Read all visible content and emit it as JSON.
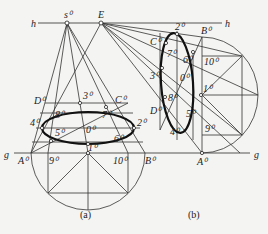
{
  "figure": {
    "lines": {
      "horizon": "h",
      "ground": "g"
    },
    "points": {
      "station": "s",
      "vanishing": "E"
    },
    "subfigure_a": {
      "caption": "(a)",
      "labels": [
        "D⁰",
        "3⁰",
        "C⁰",
        "8⁰",
        "7⁰",
        "4⁰",
        "0⁰",
        "2⁰",
        "5⁰",
        "6⁰",
        "A⁰",
        "9⁰",
        "1⁰",
        "10⁰",
        "B⁰"
      ]
    },
    "subfigure_b": {
      "caption": "(b)",
      "labels": [
        "2⁰",
        "B⁰",
        "C⁰",
        "7⁰",
        "6⁰",
        "10⁰",
        "3⁰",
        "0⁰",
        "1⁰",
        "D⁰",
        "8⁰",
        "5⁰",
        "4⁰",
        "9⁰",
        "A⁰"
      ]
    }
  },
  "labels": {
    "h_left": "h",
    "h_right": "h",
    "g_left": "g",
    "g_right": "g",
    "s": "s⁰",
    "E": "E",
    "a": {
      "D": "D⁰",
      "three": "3⁰",
      "C": "C⁰",
      "eight": "8⁰",
      "seven": "7⁰",
      "four": "4⁰",
      "zero": "0⁰",
      "two": "2⁰",
      "five": "5⁰",
      "six": "6⁰",
      "A": "A⁰",
      "nine": "9⁰",
      "one": "1⁰",
      "ten": "10⁰",
      "B": "B⁰",
      "caption": "(a)"
    },
    "b": {
      "two": "2⁰",
      "B": "B⁰",
      "C": "C⁰",
      "seven": "7⁰",
      "six": "6⁰",
      "ten": "10⁰",
      "three": "3⁰",
      "zero": "0⁰",
      "one": "1⁰",
      "D": "D⁰",
      "eight": "8⁰",
      "five": "5⁰",
      "four": "4⁰",
      "nine": "9⁰",
      "A": "A⁰",
      "caption": "(b)"
    }
  }
}
